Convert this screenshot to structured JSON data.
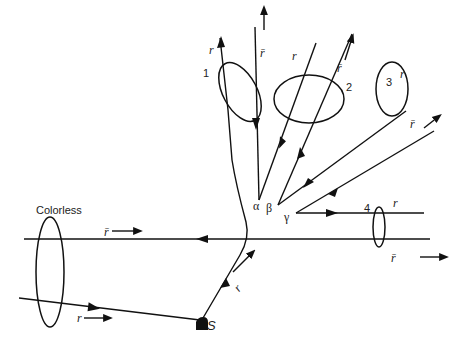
{
  "diagram": {
    "title_label": "Colorless",
    "source_label": "S",
    "vertices": {
      "alpha": "α",
      "beta": "β",
      "gamma": "γ"
    },
    "loops": [
      {
        "id": "1",
        "label": "1"
      },
      {
        "id": "2",
        "label": "2"
      },
      {
        "id": "3",
        "label": "3"
      },
      {
        "id": "4",
        "label": "4"
      }
    ],
    "color_labels": {
      "r": "r",
      "rbar": "r̄"
    },
    "colors": {
      "line": "#111111",
      "background": "#ffffff"
    }
  }
}
